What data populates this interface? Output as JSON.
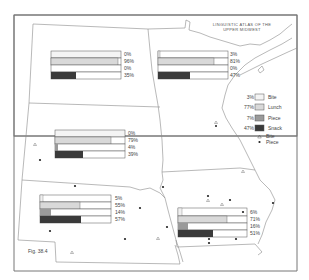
{
  "map": {
    "title_line1": "LINGUISTIC ATLAS OF THE",
    "title_line2": "UPPER MIDWEST",
    "figure_label": "Fig. 38.4",
    "colors": {
      "frame": "#777777",
      "border": "#8a8a8a",
      "bite": "#f4f4f4",
      "lunch": "#d9d9d9",
      "piece": "#9a9a9a",
      "snack": "#3a3a3a",
      "bar_outline": "#555555"
    }
  },
  "legend": {
    "items": [
      {
        "pct": "3%",
        "label": "Bite",
        "swatch": "bite"
      },
      {
        "pct": "77%",
        "label": "Lunch",
        "swatch": "lunch"
      },
      {
        "pct": "7%",
        "label": "Piece",
        "swatch": "piece"
      },
      {
        "pct": "47%",
        "label": "Snack",
        "swatch": "snack"
      }
    ],
    "symbols": [
      {
        "glyph": "triangle-icon",
        "label": "Bite"
      },
      {
        "glyph": "dot-icon",
        "label": "Piece"
      }
    ]
  },
  "regions": [
    {
      "name": "North Dakota",
      "bars": [
        {
          "term": "Bite",
          "pct": 0,
          "label": "0%"
        },
        {
          "term": "Lunch",
          "pct": 96,
          "label": "96%"
        },
        {
          "term": "Piece",
          "pct": 0,
          "label": "0%"
        },
        {
          "term": "Snack",
          "pct": 35,
          "label": "35%"
        }
      ]
    },
    {
      "name": "Minnesota",
      "bars": [
        {
          "term": "Bite",
          "pct": 3,
          "label": "3%"
        },
        {
          "term": "Lunch",
          "pct": 81,
          "label": "81%"
        },
        {
          "term": "Piece",
          "pct": 0,
          "label": "0%"
        },
        {
          "term": "Snack",
          "pct": 47,
          "label": "47%"
        }
      ]
    },
    {
      "name": "South Dakota",
      "bars": [
        {
          "term": "Bite",
          "pct": 0,
          "label": "0%"
        },
        {
          "term": "Lunch",
          "pct": 79,
          "label": "79%"
        },
        {
          "term": "Piece",
          "pct": 4,
          "label": "4%"
        },
        {
          "term": "Snack",
          "pct": 39,
          "label": "39%"
        }
      ]
    },
    {
      "name": "Nebraska",
      "bars": [
        {
          "term": "Bite",
          "pct": 5,
          "label": "5%"
        },
        {
          "term": "Lunch",
          "pct": 55,
          "label": "55%"
        },
        {
          "term": "Piece",
          "pct": 14,
          "label": "14%"
        },
        {
          "term": "Snack",
          "pct": 57,
          "label": "57%"
        }
      ]
    },
    {
      "name": "Iowa",
      "bars": [
        {
          "term": "Bite",
          "pct": 6,
          "label": "6%"
        },
        {
          "term": "Lunch",
          "pct": 71,
          "label": "71%"
        },
        {
          "term": "Piece",
          "pct": 16,
          "label": "16%"
        },
        {
          "term": "Snack",
          "pct": 51,
          "label": "51%"
        }
      ]
    }
  ]
}
